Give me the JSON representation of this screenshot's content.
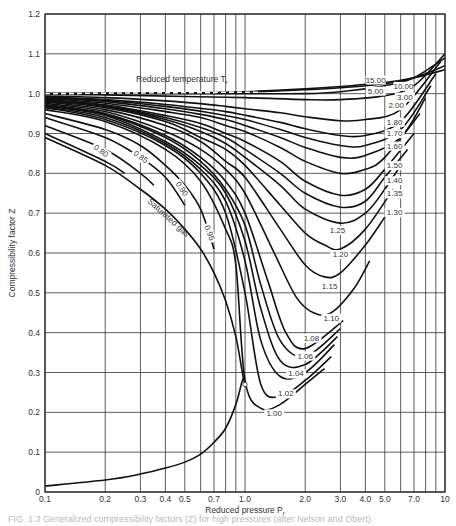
{
  "chart_data": {
    "type": "line",
    "title": "",
    "xlabel": "Reduced pressure P_r",
    "ylabel": "Compressibility factor Z",
    "xscale": "log",
    "xlim": [
      0.1,
      10
    ],
    "ylim": [
      0,
      1.2
    ],
    "grid": true,
    "legend": "none (curves labeled inline)",
    "x_ticks": [
      "0.1",
      "0.2",
      "0.3",
      "0.4",
      "0.5",
      "0.7",
      "1.0",
      "2.0",
      "3.0",
      "4.0",
      "5.0",
      "7.0",
      "10"
    ],
    "x_gridlines": [
      0.1,
      0.2,
      0.3,
      0.4,
      0.5,
      0.6,
      0.7,
      0.8,
      0.9,
      1.0,
      2,
      3,
      4,
      5,
      6,
      7,
      8,
      9,
      10
    ],
    "y_ticks": [
      "0",
      "0.1",
      "0.2",
      "0.3",
      "0.4",
      "0.5",
      "0.6",
      "0.7",
      "0.8",
      "0.9",
      "1.0",
      "1.1",
      "1.2"
    ],
    "annotations": [
      "Reduced temperature T_r",
      "Saturated gas"
    ],
    "series": [
      {
        "name": "Saturated gas",
        "style": "solid",
        "x": [
          0.1,
          0.2,
          0.3,
          0.4,
          0.5,
          0.6,
          0.7,
          0.8,
          0.9,
          0.97,
          1.0
        ],
        "y": [
          0.015,
          0.03,
          0.045,
          0.06,
          0.075,
          0.095,
          0.125,
          0.16,
          0.22,
          0.28,
          0.29
        ]
      },
      {
        "name": "Saturated gas (vapor side)",
        "style": "solid",
        "x": [
          0.1,
          0.2,
          0.3,
          0.4,
          0.5,
          0.6,
          0.7,
          0.8,
          0.9,
          0.97,
          1.0
        ],
        "y": [
          0.89,
          0.82,
          0.76,
          0.71,
          0.66,
          0.61,
          0.55,
          0.48,
          0.39,
          0.3,
          0.27
        ]
      },
      {
        "name": "0.80",
        "x": [
          0.1,
          0.2,
          0.25
        ],
        "y": [
          0.9,
          0.83,
          0.8
        ]
      },
      {
        "name": "0.85",
        "x": [
          0.1,
          0.2,
          0.3,
          0.35
        ],
        "y": [
          0.92,
          0.86,
          0.8,
          0.77
        ]
      },
      {
        "name": "0.90",
        "x": [
          0.1,
          0.2,
          0.3,
          0.4,
          0.5
        ],
        "y": [
          0.94,
          0.89,
          0.84,
          0.79,
          0.72
        ]
      },
      {
        "name": "0.95",
        "x": [
          0.1,
          0.2,
          0.3,
          0.4,
          0.5,
          0.6,
          0.7
        ],
        "y": [
          0.95,
          0.91,
          0.87,
          0.82,
          0.77,
          0.71,
          0.61
        ]
      },
      {
        "name": "1.00",
        "x": [
          0.1,
          0.2,
          0.4,
          0.6,
          0.8,
          0.9,
          1.0,
          1.2,
          1.5,
          2.0,
          2.5
        ],
        "y": [
          0.96,
          0.93,
          0.86,
          0.78,
          0.66,
          0.57,
          0.28,
          0.21,
          0.22,
          0.27,
          0.31
        ]
      },
      {
        "name": "1.02",
        "x": [
          0.1,
          0.2,
          0.4,
          0.6,
          0.8,
          1.0,
          1.2,
          1.5,
          2.0,
          2.7
        ],
        "y": [
          0.965,
          0.935,
          0.87,
          0.8,
          0.7,
          0.5,
          0.27,
          0.24,
          0.28,
          0.34
        ]
      },
      {
        "name": "1.04",
        "x": [
          0.1,
          0.2,
          0.4,
          0.6,
          0.8,
          1.0,
          1.2,
          1.5,
          2.0,
          2.8
        ],
        "y": [
          0.967,
          0.94,
          0.875,
          0.81,
          0.73,
          0.58,
          0.38,
          0.29,
          0.3,
          0.37
        ]
      },
      {
        "name": "1.06",
        "x": [
          0.1,
          0.2,
          0.4,
          0.6,
          0.8,
          1.0,
          1.2,
          1.5,
          2.0,
          2.9
        ],
        "y": [
          0.969,
          0.945,
          0.88,
          0.82,
          0.75,
          0.63,
          0.46,
          0.33,
          0.32,
          0.39
        ]
      },
      {
        "name": "1.08",
        "x": [
          0.1,
          0.2,
          0.4,
          0.6,
          0.8,
          1.0,
          1.2,
          1.5,
          2.0,
          3.0
        ],
        "y": [
          0.971,
          0.948,
          0.89,
          0.83,
          0.76,
          0.67,
          0.52,
          0.38,
          0.34,
          0.41
        ]
      },
      {
        "name": "1.10",
        "x": [
          0.1,
          0.2,
          0.4,
          0.6,
          0.8,
          1.0,
          1.3,
          1.6,
          2.0,
          3.1
        ],
        "y": [
          0.973,
          0.95,
          0.895,
          0.84,
          0.78,
          0.7,
          0.53,
          0.4,
          0.36,
          0.43
        ]
      },
      {
        "name": "1.15",
        "x": [
          0.1,
          0.2,
          0.4,
          0.6,
          0.8,
          1.0,
          1.4,
          1.8,
          2.2,
          2.7,
          3.5,
          4.2
        ],
        "y": [
          0.976,
          0.955,
          0.905,
          0.86,
          0.81,
          0.75,
          0.6,
          0.49,
          0.45,
          0.45,
          0.51,
          0.58
        ]
      },
      {
        "name": "1.20",
        "x": [
          0.1,
          0.2,
          0.4,
          0.6,
          0.8,
          1.0,
          1.5,
          2.0,
          2.5,
          3.0,
          4.0,
          5.0
        ],
        "y": [
          0.979,
          0.96,
          0.92,
          0.88,
          0.83,
          0.79,
          0.66,
          0.57,
          0.54,
          0.55,
          0.62,
          0.69
        ]
      },
      {
        "name": "1.25",
        "x": [
          0.1,
          0.2,
          0.4,
          0.6,
          0.8,
          1.0,
          1.5,
          2.0,
          2.5,
          3.0,
          4.0,
          5.5
        ],
        "y": [
          0.981,
          0.965,
          0.93,
          0.89,
          0.86,
          0.82,
          0.72,
          0.65,
          0.62,
          0.61,
          0.66,
          0.76
        ]
      },
      {
        "name": "1.30",
        "x": [
          0.1,
          0.2,
          0.4,
          0.6,
          0.8,
          1.0,
          1.5,
          2.0,
          3.0,
          4.0,
          5.0,
          6.0
        ],
        "y": [
          0.983,
          0.968,
          0.935,
          0.905,
          0.875,
          0.84,
          0.77,
          0.71,
          0.675,
          0.7,
          0.76,
          0.82
        ]
      },
      {
        "name": "1.35",
        "x": [
          0.1,
          0.2,
          0.4,
          0.6,
          0.8,
          1.0,
          1.5,
          2.0,
          3.0,
          4.0,
          5.0,
          6.5
        ],
        "y": [
          0.985,
          0.97,
          0.94,
          0.915,
          0.89,
          0.86,
          0.8,
          0.75,
          0.715,
          0.73,
          0.79,
          0.86
        ]
      },
      {
        "name": "1.40",
        "x": [
          0.1,
          0.2,
          0.4,
          0.6,
          0.8,
          1.0,
          1.5,
          2.0,
          3.0,
          4.0,
          5.0,
          7.0
        ],
        "y": [
          0.986,
          0.972,
          0.945,
          0.925,
          0.9,
          0.88,
          0.83,
          0.78,
          0.745,
          0.76,
          0.81,
          0.9
        ]
      },
      {
        "name": "1.50",
        "x": [
          0.1,
          0.2,
          0.4,
          0.6,
          0.8,
          1.0,
          1.5,
          2.0,
          3.0,
          4.0,
          5.0,
          7.5
        ],
        "y": [
          0.988,
          0.976,
          0.955,
          0.94,
          0.92,
          0.905,
          0.865,
          0.83,
          0.8,
          0.81,
          0.84,
          0.95
        ]
      },
      {
        "name": "1.60",
        "x": [
          0.1,
          0.2,
          0.4,
          0.6,
          0.8,
          1.0,
          1.5,
          2.0,
          3.0,
          4.0,
          6.0,
          8.0
        ],
        "y": [
          0.99,
          0.98,
          0.962,
          0.948,
          0.935,
          0.92,
          0.89,
          0.865,
          0.84,
          0.845,
          0.89,
          0.99
        ]
      },
      {
        "name": "1.70",
        "x": [
          0.1,
          0.2,
          0.4,
          0.6,
          0.8,
          1.0,
          1.5,
          2.0,
          3.0,
          4.0,
          6.0,
          8.5
        ],
        "y": [
          0.991,
          0.983,
          0.968,
          0.956,
          0.945,
          0.935,
          0.91,
          0.89,
          0.87,
          0.87,
          0.91,
          1.02
        ]
      },
      {
        "name": "1.80",
        "x": [
          0.1,
          0.2,
          0.4,
          0.6,
          0.8,
          1.0,
          1.5,
          2.0,
          3.0,
          4.0,
          6.0,
          9.0
        ],
        "y": [
          0.992,
          0.985,
          0.973,
          0.963,
          0.955,
          0.946,
          0.928,
          0.912,
          0.895,
          0.895,
          0.93,
          1.05
        ]
      },
      {
        "name": "2.00",
        "x": [
          0.1,
          0.2,
          0.4,
          0.6,
          0.8,
          1.0,
          1.5,
          2.0,
          3.0,
          4.0,
          6.0,
          9.5
        ],
        "y": [
          0.994,
          0.99,
          0.982,
          0.975,
          0.968,
          0.962,
          0.952,
          0.942,
          0.932,
          0.935,
          0.96,
          1.08
        ]
      },
      {
        "name": "3.00",
        "x": [
          0.1,
          0.2,
          0.5,
          1.0,
          2.0,
          3.0,
          5.0,
          7.0,
          10
        ],
        "y": [
          0.998,
          0.997,
          0.993,
          0.99,
          0.985,
          0.985,
          0.995,
          1.02,
          1.1
        ]
      },
      {
        "name": "5.00",
        "x": [
          0.1,
          0.2,
          0.5,
          1.0,
          2.0,
          3.0,
          5.0,
          7.0,
          10
        ],
        "y": [
          1.0,
          1.0,
          1.0,
          1.0,
          1.0,
          1.005,
          1.02,
          1.04,
          1.09
        ]
      },
      {
        "name": "10.00",
        "x": [
          0.1,
          0.5,
          1.0,
          2.0,
          3.0,
          5.0,
          7.0,
          10
        ],
        "y": [
          1.0,
          1.002,
          1.004,
          1.01,
          1.015,
          1.025,
          1.04,
          1.07
        ]
      },
      {
        "name": "15.00",
        "x": [
          0.1,
          0.5,
          1.0,
          2.0,
          3.0,
          5.0,
          7.0,
          10
        ],
        "y": [
          1.0,
          1.002,
          1.005,
          1.012,
          1.018,
          1.028,
          1.04,
          1.06
        ]
      }
    ],
    "critical_point": {
      "x": 1.0,
      "y": 0.27,
      "marker": "open circle"
    }
  },
  "labels": {
    "y_axis_title": "Compressibility factor Z",
    "x_axis_title": "Reduced pressure P",
    "x_axis_sub": "r",
    "tr_header": "Reduced temperature T",
    "tr_header_sub": "r",
    "saturated_gas": "Saturated gas",
    "caption": "FIG. 1.3  Generalized compressibility factors (Z) for high pressures (after Nelson and Obert)."
  },
  "inline_labels": [
    {
      "text": "15.00",
      "x": 4.5,
      "y": 1.028,
      "rot": 0
    },
    {
      "text": "10.00",
      "x": 6.2,
      "y": 1.012,
      "rot": 0
    },
    {
      "text": "5.00",
      "x": 4.5,
      "y": 1.0,
      "rot": 0
    },
    {
      "text": "3.00",
      "x": 6.3,
      "y": 0.985,
      "rot": 0
    },
    {
      "text": "2.00",
      "x": 5.7,
      "y": 0.963,
      "rot": 0
    },
    {
      "text": "1.80",
      "x": 5.6,
      "y": 0.922,
      "rot": 0
    },
    {
      "text": "1.70",
      "x": 5.6,
      "y": 0.893,
      "rot": 0
    },
    {
      "text": "1.60",
      "x": 5.6,
      "y": 0.862,
      "rot": 0
    },
    {
      "text": "1.50",
      "x": 5.6,
      "y": 0.813,
      "rot": 0
    },
    {
      "text": "1.40",
      "x": 5.6,
      "y": 0.775,
      "rot": 0
    },
    {
      "text": "1.35",
      "x": 5.6,
      "y": 0.742,
      "rot": 0
    },
    {
      "text": "1.30",
      "x": 5.6,
      "y": 0.695,
      "rot": 0
    },
    {
      "text": "1.25",
      "x": 2.9,
      "y": 0.65,
      "rot": 0
    },
    {
      "text": "1.20",
      "x": 3.0,
      "y": 0.59,
      "rot": 0
    },
    {
      "text": "1.15",
      "x": 2.65,
      "y": 0.51,
      "rot": 0
    },
    {
      "text": "1.10",
      "x": 2.7,
      "y": 0.43,
      "rot": 0
    },
    {
      "text": "1.08",
      "x": 2.15,
      "y": 0.38,
      "rot": 0
    },
    {
      "text": "1.06",
      "x": 2.0,
      "y": 0.335,
      "rot": 0
    },
    {
      "text": "1.04",
      "x": 1.8,
      "y": 0.29,
      "rot": 0
    },
    {
      "text": "1.02",
      "x": 1.6,
      "y": 0.24,
      "rot": 0
    },
    {
      "text": "1.00",
      "x": 1.4,
      "y": 0.19,
      "rot": 0
    },
    {
      "text": "0.80",
      "x": 0.19,
      "y": 0.85,
      "rot": 35
    },
    {
      "text": "0.85",
      "x": 0.3,
      "y": 0.835,
      "rot": 35
    },
    {
      "text": "0.90",
      "x": 0.48,
      "y": 0.755,
      "rot": 55
    },
    {
      "text": "0.95",
      "x": 0.66,
      "y": 0.645,
      "rot": 70
    }
  ]
}
